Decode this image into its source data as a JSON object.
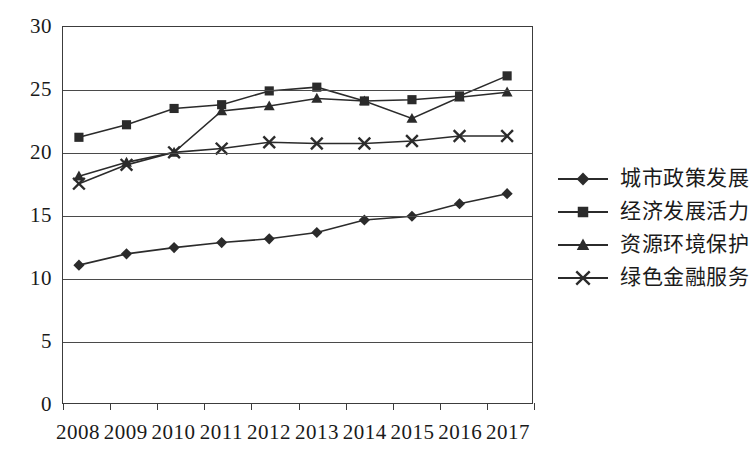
{
  "chart_data": {
    "type": "line",
    "title": "",
    "xlabel": "",
    "ylabel": "",
    "ylim": [
      0,
      30
    ],
    "ytick_labels": [
      "30",
      "25",
      "20",
      "15",
      "10",
      "5",
      "0"
    ],
    "ytick_values": [
      30,
      25,
      20,
      15,
      10,
      5,
      0
    ],
    "grid": true,
    "legend_position": "right",
    "categories": [
      "2008",
      "2009",
      "2010",
      "2011",
      "2012",
      "2013",
      "2014",
      "2015",
      "2016",
      "2017"
    ],
    "series": [
      {
        "name": "城市政策发展",
        "marker": "diamond",
        "color": "#2b2b2b",
        "values": [
          11.0,
          11.9,
          12.4,
          12.8,
          13.1,
          13.6,
          14.6,
          14.9,
          15.9,
          16.7
        ]
      },
      {
        "name": "经济发展活力",
        "marker": "square",
        "color": "#2b2b2b",
        "values": [
          21.2,
          22.2,
          23.5,
          23.8,
          24.9,
          25.2,
          24.1,
          24.2,
          24.5,
          26.1
        ]
      },
      {
        "name": "资源环境保护",
        "marker": "triangle",
        "color": "#2b2b2b",
        "values": [
          18.1,
          19.2,
          20.0,
          23.3,
          23.7,
          24.3,
          24.1,
          22.7,
          24.4,
          24.8
        ]
      },
      {
        "name": "绿色金融服务",
        "marker": "cross",
        "color": "#2b2b2b",
        "values": [
          17.5,
          19.0,
          20.0,
          20.3,
          20.8,
          20.7,
          20.7,
          20.9,
          21.3,
          21.3
        ]
      }
    ]
  }
}
